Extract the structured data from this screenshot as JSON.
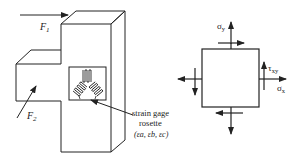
{
  "left_figure": {
    "force1_label": "F",
    "force1_sub": "1",
    "force2_label": "F",
    "force2_sub": "2",
    "rosette_label_line1": "strain gage",
    "rosette_label_line2": "rosette",
    "rosette_label_line3": "(εa, εb, εc)"
  },
  "right_figure": {
    "sigma_y": "σ",
    "sigma_y_sub": "y",
    "sigma_x": "σ",
    "sigma_x_sub": "x",
    "tau_xy": "τ",
    "tau_xy_sub": "xy"
  },
  "colors": {
    "line": "#222222",
    "background": "#ffffff"
  }
}
